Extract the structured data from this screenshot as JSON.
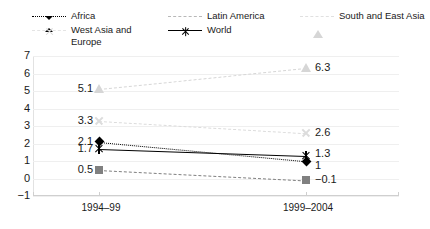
{
  "chart_data": {
    "type": "line",
    "title": "",
    "subtitle": "",
    "xlabel": "",
    "ylabel": "",
    "categories": [
      "1994–99",
      "1999–2004"
    ],
    "ylim": [
      -1,
      7
    ],
    "ytick_labels": [
      "7",
      "6",
      "5",
      "4",
      "3",
      "2",
      "1",
      "0",
      "−1"
    ],
    "ytick_values": [
      7,
      6,
      5,
      4,
      3,
      2,
      1,
      0,
      -1
    ],
    "grid": true,
    "legend_position": "top",
    "series": [
      {
        "name": "Africa",
        "values": [
          2.1,
          1.0
        ],
        "labels": [
          "2.1",
          "1"
        ],
        "color": "#000000",
        "marker": "diamond",
        "line_style": "dotted"
      },
      {
        "name": "Latin America",
        "values": [
          0.5,
          -0.1
        ],
        "labels": [
          "0.5",
          "−0.1"
        ],
        "color": "#808080",
        "marker": "square",
        "line_style": "dash-dot"
      },
      {
        "name": "South and East Asia",
        "values": [
          5.1,
          6.3
        ],
        "labels": [
          "5.1",
          "6.3"
        ],
        "color": "#d6d6d6",
        "marker": "triangle",
        "line_style": "dash-dot"
      },
      {
        "name": "West Asia and Europe",
        "values": [
          3.3,
          2.6
        ],
        "labels": [
          "3.3",
          "2.6"
        ],
        "color": "#dcdcdc",
        "marker": "x",
        "line_style": "dash-dot"
      },
      {
        "name": "World",
        "values": [
          1.7,
          1.3
        ],
        "labels": [
          "1.7",
          "1.3"
        ],
        "color": "#000000",
        "marker": "star",
        "line_style": "solid"
      }
    ]
  },
  "legend": {
    "columns": [
      {
        "entries": [
          "Africa",
          "West Asia and Europe"
        ]
      },
      {
        "entries": [
          "Latin America",
          "World"
        ]
      },
      {
        "entries": [
          "South and East Asia"
        ]
      }
    ]
  }
}
